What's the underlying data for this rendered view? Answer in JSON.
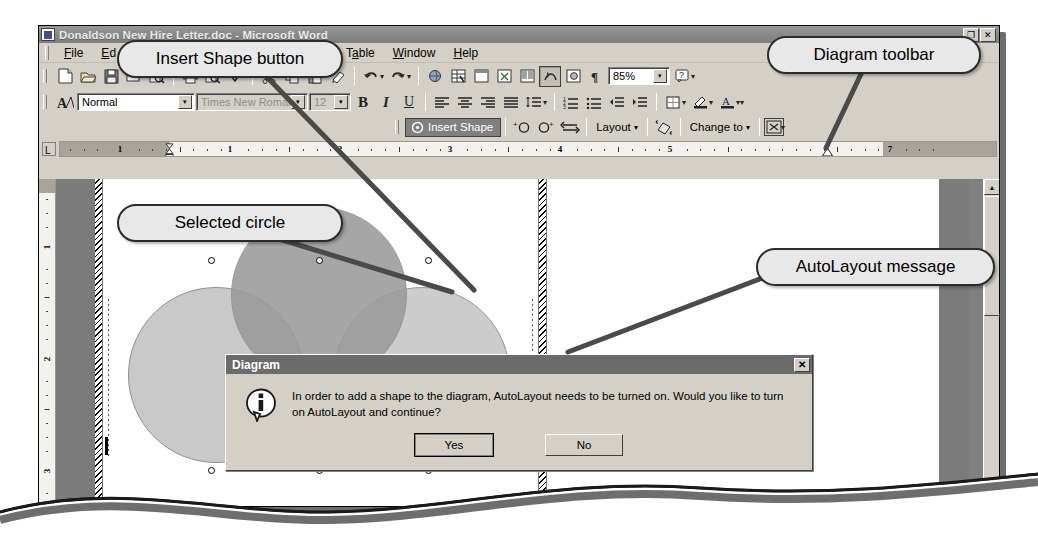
{
  "window": {
    "title": "Donaldson New Hire Letter.doc - Microsoft Word",
    "restore_label": "❐",
    "close_label": "✕",
    "doc_restore_label": "❐",
    "doc_close_label": "✕"
  },
  "menu": {
    "items": [
      {
        "label": "File",
        "accel": "F"
      },
      {
        "label": "Edit",
        "accel": "E"
      },
      {
        "label": "View",
        "accel": "V"
      },
      {
        "label": "Insert",
        "accel": "I"
      },
      {
        "label": "Format",
        "accel": "o"
      },
      {
        "label": "Tools",
        "accel": "T"
      },
      {
        "label": "Table",
        "accel": "a"
      },
      {
        "label": "Window",
        "accel": "W"
      },
      {
        "label": "Help",
        "accel": "H"
      }
    ]
  },
  "standard_toolbar": {
    "buttons": [
      "new-document-icon",
      "open-icon",
      "save-icon",
      "mail-recipient-icon",
      "search-icon",
      "print-icon",
      "print-preview-icon",
      "spelling-grammar-icon",
      "cut-icon",
      "copy-icon",
      "paste-icon",
      "format-painter-icon",
      "undo-icon",
      "redo-icon",
      "insert-hyperlink-icon",
      "tables-and-borders-icon",
      "insert-table-icon",
      "insert-excel-spreadsheet-icon",
      "columns-icon",
      "drawing-icon",
      "document-map-icon",
      "show-formatting-marks-icon"
    ],
    "zoom_value": "85%",
    "help_icon": "help-icon"
  },
  "formatting_toolbar": {
    "styles_icon": "styles-and-formatting-icon",
    "style_value": "Normal",
    "font_value": "Times New Roman",
    "size_value": "12",
    "bold": "B",
    "italic": "I",
    "underline": "U",
    "buttons": [
      "align-left-icon",
      "align-center-icon",
      "align-right-icon",
      "justify-icon",
      "line-spacing-icon",
      "numbered-list-icon",
      "bulleted-list-icon",
      "decrease-indent-icon",
      "increase-indent-icon",
      "outside-border-icon",
      "highlight-icon",
      "font-color-icon"
    ]
  },
  "diagram_toolbar": {
    "insert_shape_label": "Insert Shape",
    "insert_shape_accel": "n",
    "move_backward_icon": "move-shape-backward-icon",
    "move_forward_icon": "move-shape-forward-icon",
    "reverse_icon": "reverse-diagram-icon",
    "layout_label": "Layout",
    "layout_accel": "L",
    "autoformat_icon": "autoformat-icon",
    "change_to_label": "Change to",
    "change_to_accel": "C",
    "text_wrapping_icon": "text-wrapping-icon",
    "dropdown_caret": "▾"
  },
  "ruler": {
    "tab_selector_glyph": "L",
    "horizontal_numbers": [
      "1",
      "1",
      "2",
      "3",
      "4",
      "5",
      "7"
    ],
    "vertical_numbers": [
      "1",
      "2",
      "3"
    ]
  },
  "document": {
    "diagram_label": "Integrity",
    "venn_fill_selected": "#9a9a9a",
    "venn_fill_light": "#c9c9c9",
    "venn_fill_mid": "#b4b4b4",
    "page_background": "#ffffff",
    "workspace_background": "#7b7b7b"
  },
  "dialog": {
    "title": "Diagram",
    "close_label": "✕",
    "icon": "information-icon",
    "message": "In order to add a shape to the diagram, AutoLayout needs to be turned on. Would you like to turn on AutoLayout and continue?",
    "yes_label": "Yes",
    "no_label": "No"
  },
  "scrollbar": {
    "up_arrow": "▲",
    "down_arrow": "▼"
  },
  "callouts": [
    {
      "id": "insert-shape-button",
      "label": "Insert Shape button"
    },
    {
      "id": "diagram-toolbar",
      "label": "Diagram toolbar"
    },
    {
      "id": "selected-circle",
      "label": "Selected circle"
    },
    {
      "id": "autolayout-message",
      "label": "AutoLayout message"
    }
  ]
}
